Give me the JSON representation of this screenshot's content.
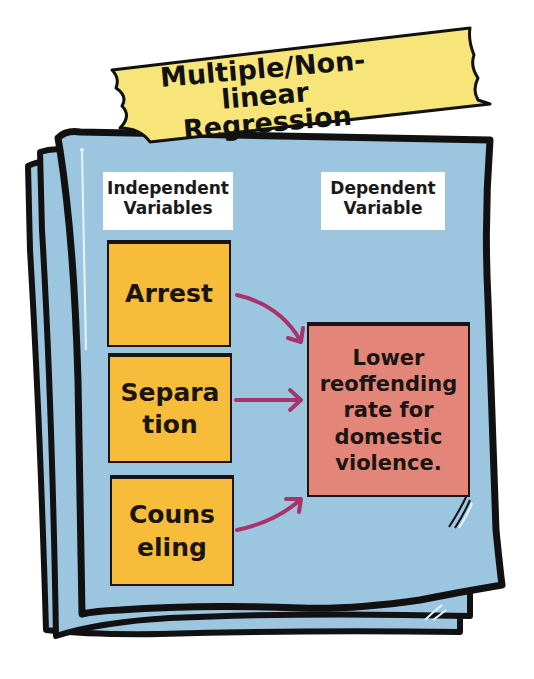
{
  "title": {
    "line1": "Multiple/Non-linear",
    "line2": "Regression"
  },
  "headers": {
    "independent": "Independent Variables",
    "independent_line1": "Independent",
    "independent_line2": "Variables",
    "dependent": "Dependent Variable",
    "dependent_line1": "Dependent",
    "dependent_line2": "Variable"
  },
  "independent_variables": [
    {
      "label": "Arrest",
      "line1": "Arrest",
      "line2": ""
    },
    {
      "label": "Separation",
      "line1": "Separa",
      "line2": "tion"
    },
    {
      "label": "Counseling",
      "line1": "Couns",
      "line2": "eling"
    }
  ],
  "dependent_variable": {
    "label": "Lower reoffending rate for domestic violence.",
    "lines": [
      "Lower",
      "reoffending",
      "rate for",
      "domestic",
      "violence."
    ]
  },
  "colors": {
    "paper": "#9cc6df",
    "tape": "#f7e57a",
    "sticky_note": "#f7bd3a",
    "target_box": "#e38579",
    "arrow": "#a8336b",
    "outline": "#111111"
  }
}
